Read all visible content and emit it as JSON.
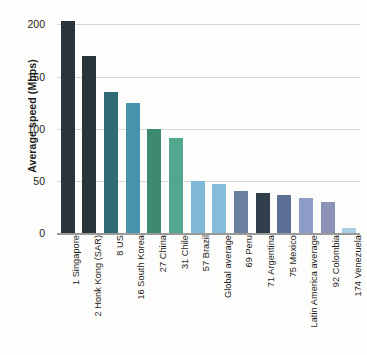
{
  "chart_data": {
    "type": "bar",
    "title": "",
    "xlabel": "",
    "ylabel": "Average speed (Mbps)",
    "ylim": [
      0,
      210
    ],
    "yticks": [
      0,
      50,
      100,
      150,
      200
    ],
    "ytick_labels": [
      "0",
      "50",
      "100",
      "150",
      "200"
    ],
    "grid": true,
    "legend": "none",
    "categories": [
      "1 Singapore",
      "2 Honk Kong (SAR)",
      "8 US",
      "16 South Korea",
      "27 China",
      "31 Chile",
      "57 Brazil",
      "Global average",
      "69 Peru",
      "71 Argentina",
      "75 Mexico",
      "Latin America average",
      "92 Colombia",
      "174 Venezuela"
    ],
    "values": [
      203,
      170,
      135,
      125,
      100,
      91,
      50,
      47,
      40,
      38,
      36,
      34,
      30,
      5
    ],
    "bar_colors": [
      "#2b343c",
      "#27343a",
      "#2f6b74",
      "#4a93ae",
      "#3d8a6e",
      "#52a88f",
      "#7fb8d8",
      "#84bcdc",
      "#6b7f9e",
      "#313f4d",
      "#5e6f96",
      "#8e9cc9",
      "#8d92b8",
      "#a8cfe4"
    ]
  },
  "axis": {
    "y_title": "Average speed (Mbps)"
  },
  "colors": {
    "gridline": "#d8d8d6",
    "axis_line": "#9a9a98",
    "text": "#1d1d1b",
    "background": "#fdfdfc"
  }
}
